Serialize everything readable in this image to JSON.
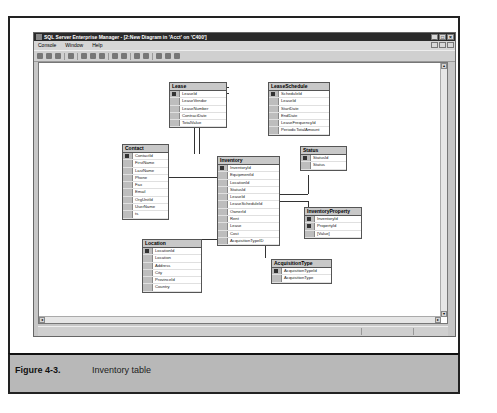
{
  "window": {
    "title": "SQL Server Enterprise Manager - [2:New Diagram in 'Acct' on 'C400']",
    "buttons": [
      "_",
      "□",
      "×"
    ],
    "mdi_buttons": [
      "_",
      "□",
      "×"
    ]
  },
  "menu": {
    "items": [
      {
        "label": "Console"
      },
      {
        "label": "Window"
      },
      {
        "label": "Help"
      }
    ]
  },
  "toolbar": {
    "icons": [
      "save-icon",
      "properties-icon",
      "print-icon",
      "layout-icon",
      "cut-icon",
      "copy-icon",
      "paste-icon",
      "new-table-icon",
      "add-table-icon",
      "zoom-icon",
      "zoom-value-icon",
      "help-icon",
      "arrange-icon",
      "relationship-icon"
    ]
  },
  "diagram": {
    "tables": [
      {
        "id": "lease",
        "name": "Lease",
        "columns": [
          {
            "name": "LeaseId",
            "key": true
          },
          {
            "name": "LeaseVendor",
            "key": false
          },
          {
            "name": "LeaseNumber",
            "key": false
          },
          {
            "name": "ContractDate",
            "key": false
          },
          {
            "name": "TotalValue",
            "key": false
          }
        ]
      },
      {
        "id": "leaseschedule",
        "name": "LeaseSchedule",
        "columns": [
          {
            "name": "ScheduleId",
            "key": true
          },
          {
            "name": "LeaseId",
            "key": false
          },
          {
            "name": "StartDate",
            "key": false
          },
          {
            "name": "EndDate",
            "key": false
          },
          {
            "name": "LeaseFrequencyId",
            "key": false
          },
          {
            "name": "PeriodicTotalAmount",
            "key": false
          }
        ]
      },
      {
        "id": "contact",
        "name": "Contact",
        "columns": [
          {
            "name": "ContactId",
            "key": true
          },
          {
            "name": "FirstName",
            "key": false
          },
          {
            "name": "LastName",
            "key": false
          },
          {
            "name": "Phone",
            "key": false
          },
          {
            "name": "Fax",
            "key": false
          },
          {
            "name": "Email",
            "key": false
          },
          {
            "name": "OrgUnitId",
            "key": false
          },
          {
            "name": "UserName",
            "key": false
          },
          {
            "name": "ts",
            "key": false
          }
        ]
      },
      {
        "id": "inventory",
        "name": "Inventory",
        "columns": [
          {
            "name": "InventoryId",
            "key": true
          },
          {
            "name": "EquipmentId",
            "key": false
          },
          {
            "name": "LocationId",
            "key": false
          },
          {
            "name": "StatusId",
            "key": false
          },
          {
            "name": "LeaseId",
            "key": false
          },
          {
            "name": "LeaseScheduleId",
            "key": false
          },
          {
            "name": "OwnerId",
            "key": false
          },
          {
            "name": "Rent",
            "key": false
          },
          {
            "name": "Lease",
            "key": false
          },
          {
            "name": "Cost",
            "key": false
          },
          {
            "name": "AcquisitionTypeID",
            "key": false
          }
        ]
      },
      {
        "id": "status",
        "name": "Status",
        "columns": [
          {
            "name": "StatusId",
            "key": true
          },
          {
            "name": "Status",
            "key": false
          }
        ]
      },
      {
        "id": "inventoryproperty",
        "name": "InventoryProperty",
        "columns": [
          {
            "name": "InventoryId",
            "key": true
          },
          {
            "name": "PropertyId",
            "key": true
          },
          {
            "name": "[Value]",
            "key": false
          }
        ]
      },
      {
        "id": "location",
        "name": "Location",
        "columns": [
          {
            "name": "LocationId",
            "key": true
          },
          {
            "name": "Location",
            "key": false
          },
          {
            "name": "Address",
            "key": false
          },
          {
            "name": "City",
            "key": false
          },
          {
            "name": "ProvinceId",
            "key": false
          },
          {
            "name": "Country",
            "key": false
          }
        ]
      },
      {
        "id": "acquisitiontype",
        "name": "AcquisitionType",
        "columns": [
          {
            "name": "AcquisitionTypeId",
            "key": true
          },
          {
            "name": "AcquisitionType",
            "key": false
          }
        ]
      }
    ]
  },
  "caption": {
    "number": "Figure 4-3.",
    "text": "Inventory table"
  }
}
